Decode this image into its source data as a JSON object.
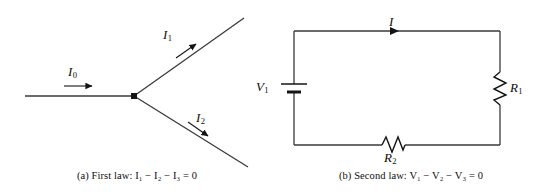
{
  "figure": {
    "panels": [
      {
        "id": "first-law",
        "caption": "(a) First law: I₁ − I₂ − I₃ = 0",
        "caption_plain": "(a) First law: I1 - I2 - I3 = 0",
        "type": "current-junction",
        "labels": {
          "incoming": "I",
          "incoming_sub": "0",
          "branch_upper": "I",
          "branch_upper_sub": "1",
          "branch_lower": "I",
          "branch_lower_sub": "2"
        },
        "geometry": {
          "junction": [
            134,
            96
          ],
          "incoming_start": [
            25,
            96
          ],
          "branch_upper_end": [
            244,
            18
          ],
          "branch_lower_end": [
            248,
            167
          ]
        }
      },
      {
        "id": "second-law",
        "caption": "(b) Second law: V₁ − V₂ − V₃ = 0",
        "caption_plain": "(b) Second law: V1 - V2 - V3 = 0",
        "type": "series-circuit-loop",
        "labels": {
          "current": "I",
          "battery": "V",
          "battery_sub": "1",
          "resistor_right": "R",
          "resistor_right_sub": "1",
          "resistor_bottom": "R",
          "resistor_bottom_sub": "2"
        },
        "geometry": {
          "loop_left": 294,
          "loop_right": 500,
          "loop_top": 31,
          "loop_bottom": 145,
          "battery_y": 88,
          "current_arrow_x": 396
        }
      }
    ],
    "colors": {
      "ink": "#0d0d0d",
      "wire": "#3a3a3a",
      "background": "#ffffff"
    }
  }
}
